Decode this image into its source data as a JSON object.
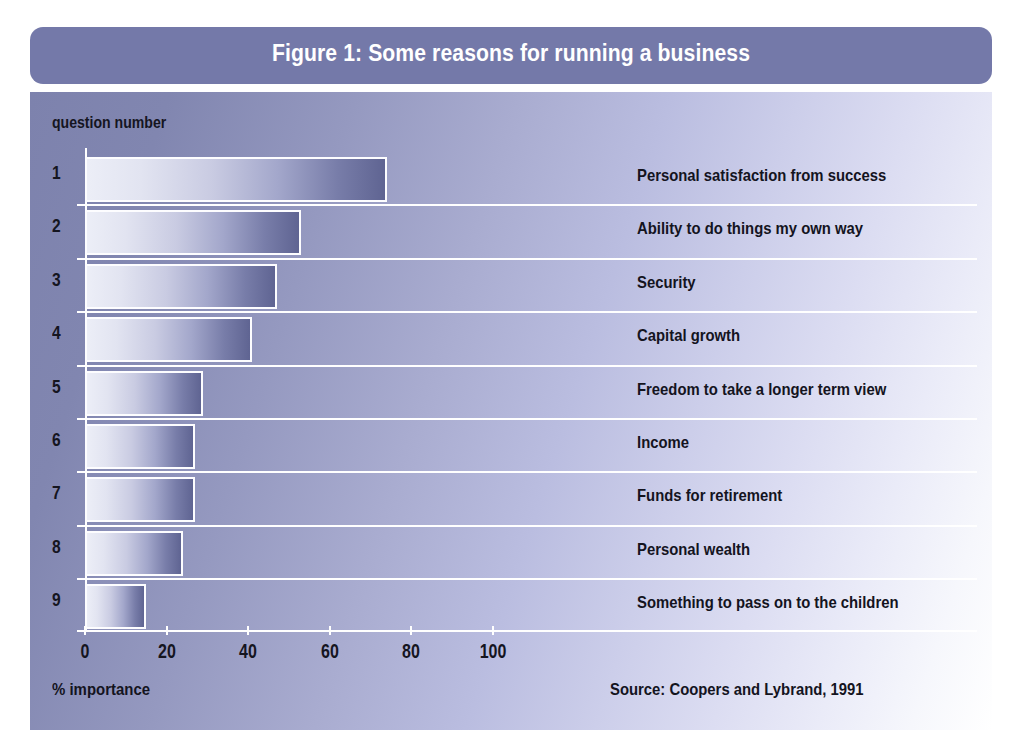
{
  "figure": {
    "title": "Figure 1: Some reasons for running a business",
    "y_axis_caption": "question number",
    "x_axis_caption": "% importance",
    "source_note": "Source: Coopers and Lybrand, 1991",
    "title_bar_color": "#7479a9",
    "bar_gradient_start": "#eceef7",
    "bar_gradient_end": "#5f6492",
    "bar_border_color": "#fdfdff",
    "gridline_color": "#ffffff",
    "text_color": "#14141e"
  },
  "chart_data": {
    "type": "bar",
    "orientation": "horizontal",
    "title": "Figure 1: Some reasons for running a business",
    "subtitle": "",
    "xlabel": "% importance",
    "ylabel": "question number",
    "xlim": [
      0,
      125
    ],
    "xticks": [
      0,
      20,
      40,
      60,
      80,
      100
    ],
    "xtick_labels": [
      "0",
      "20",
      "40",
      "60",
      "80",
      "100"
    ],
    "grid": true,
    "legend": "none",
    "annotation": "Source: Coopers and Lybrand, 1991",
    "question_numbers": [
      "1",
      "2",
      "3",
      "4",
      "5",
      "6",
      "7",
      "8",
      "9"
    ],
    "categories": [
      "Personal satisfaction from success",
      "Ability to do things my own way",
      "Security",
      "Capital growth",
      "Freedom to take a longer term view",
      "Income",
      "Funds for retirement",
      "Personal wealth",
      "Something to pass on to the children"
    ],
    "values": [
      74,
      53,
      47,
      41,
      29,
      27,
      27,
      24,
      15
    ]
  }
}
